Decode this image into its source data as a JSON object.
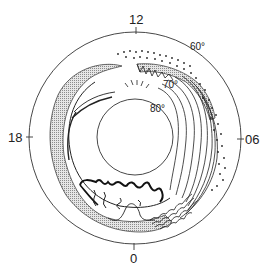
{
  "diagram": {
    "type": "polar auroral oval schematic",
    "time_labels": {
      "top": "12",
      "left": "18",
      "right": "06",
      "bottom": "0"
    },
    "latitude_labels": {
      "lat60": "60°",
      "lat70": "70°",
      "lat80": "80°"
    },
    "colors": {
      "line": "#222222",
      "stipple": "#9a9a9a",
      "background": "#ffffff"
    }
  }
}
